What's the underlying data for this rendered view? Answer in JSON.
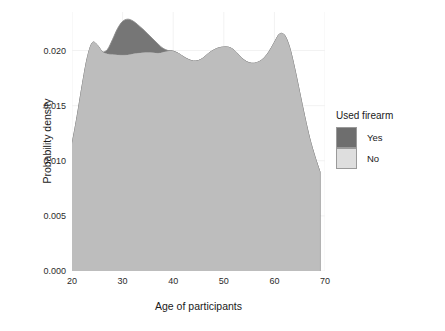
{
  "chart_data": {
    "type": "area",
    "title": "",
    "subtitle": "",
    "xlabel": "Age of participants",
    "ylabel": "Probability density",
    "xlim": [
      20,
      70
    ],
    "ylim": [
      0.0,
      0.0235
    ],
    "xticks": [
      20,
      30,
      40,
      50,
      60,
      70
    ],
    "xtick_labels": [
      "20",
      "30",
      "40",
      "50",
      "60",
      "70"
    ],
    "yticks": [
      0.0,
      0.005,
      0.01,
      0.015,
      0.02
    ],
    "ytick_labels": [
      "0.000",
      "0.005",
      "0.010",
      "0.015",
      "0.020"
    ],
    "grid": true,
    "grid_color": "#f2f2f2",
    "panel_background": "#ffffff",
    "legend": {
      "title": "Used firearm",
      "position": "right",
      "entries": [
        {
          "label": "Yes",
          "color": "#6e6e6e"
        },
        {
          "label": "No",
          "color": "#dedede"
        }
      ]
    },
    "x": [
      20,
      21,
      22,
      23,
      24,
      25,
      26,
      27,
      28,
      29,
      30,
      31,
      32,
      33,
      34,
      35,
      36,
      37,
      38,
      39,
      40,
      41,
      42,
      43,
      44,
      45,
      46,
      47,
      48,
      49,
      50,
      51,
      52,
      53,
      54,
      55,
      56,
      57,
      58,
      59,
      60,
      61,
      62,
      63,
      64,
      65,
      66,
      67,
      68,
      69
    ],
    "series": [
      {
        "name": "No",
        "color": "#dedede",
        "values": [
          0.0115,
          0.014,
          0.0168,
          0.0193,
          0.0207,
          0.0205,
          0.0199,
          0.0197,
          0.01965,
          0.0196,
          0.01958,
          0.0196,
          0.01968,
          0.01975,
          0.0198,
          0.01982,
          0.0198,
          0.01975,
          0.01985,
          0.01995,
          0.01995,
          0.01975,
          0.01945,
          0.0192,
          0.01905,
          0.0191,
          0.01935,
          0.01975,
          0.02005,
          0.02025,
          0.02032,
          0.0203,
          0.02005,
          0.0196,
          0.01915,
          0.0189,
          0.01885,
          0.019,
          0.01935,
          0.01995,
          0.02075,
          0.0215,
          0.0214,
          0.0203,
          0.0184,
          0.0162,
          0.014,
          0.012,
          0.0104,
          0.009
        ]
      },
      {
        "name": "Yes",
        "color": "#6e6e6e",
        "values": [
          0.0115,
          0.014,
          0.0168,
          0.0193,
          0.0207,
          0.0205,
          0.0199,
          0.0201,
          0.021,
          0.022,
          0.02265,
          0.02285,
          0.0227,
          0.02235,
          0.02195,
          0.0215,
          0.02105,
          0.0206,
          0.0202,
          0.02,
          0.01995,
          0.01975,
          0.01945,
          0.0192,
          0.01905,
          0.0191,
          0.01935,
          0.01975,
          0.02005,
          0.02025,
          0.02032,
          0.0203,
          0.02005,
          0.0196,
          0.01915,
          0.0189,
          0.01885,
          0.019,
          0.01935,
          0.01995,
          0.02075,
          0.0215,
          0.0214,
          0.0203,
          0.0184,
          0.0162,
          0.014,
          0.012,
          0.0104,
          0.009
        ]
      }
    ],
    "fill_colors": {
      "overlap": "#bdbdbd",
      "no_only": "#d8d8d8",
      "yes_only": "#767676",
      "outline": "#8a8a8a"
    }
  }
}
